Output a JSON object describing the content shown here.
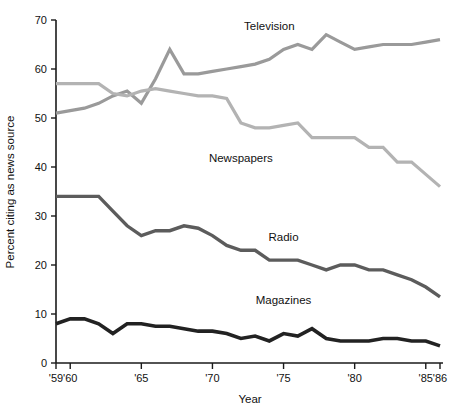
{
  "chart_data": {
    "type": "line",
    "title": "",
    "xlabel": "Year",
    "ylabel": "Percent citing as news source",
    "xlim": [
      1959,
      1986
    ],
    "ylim": [
      0,
      70
    ],
    "grid": false,
    "legend_position": "inline-labels",
    "x_tick_labels": [
      "'59",
      "'60",
      "'65",
      "'70",
      "'75",
      "'80",
      "'85",
      "'86"
    ],
    "x_tick_values": [
      1959,
      1960,
      1965,
      1970,
      1975,
      1980,
      1985,
      1986
    ],
    "y_tick_labels": [
      "0",
      "10",
      "20",
      "30",
      "40",
      "50",
      "60",
      "70"
    ],
    "y_tick_values": [
      0,
      10,
      20,
      30,
      40,
      50,
      60,
      70
    ],
    "x": [
      1959,
      1960,
      1961,
      1962,
      1963,
      1964,
      1965,
      1966,
      1967,
      1968,
      1969,
      1970,
      1971,
      1972,
      1973,
      1974,
      1975,
      1976,
      1977,
      1978,
      1979,
      1980,
      1981,
      1982,
      1983,
      1984,
      1985,
      1986
    ],
    "series": [
      {
        "name": "Television",
        "color": "#9a9a9a",
        "label_x": 1974,
        "label_y": 68,
        "values": [
          51,
          51.5,
          52,
          53,
          54.5,
          55.5,
          53,
          58,
          64,
          59,
          59,
          59.5,
          60,
          60.5,
          61,
          62,
          64,
          65,
          64,
          67,
          65.5,
          64,
          64.5,
          65,
          65,
          65,
          65.5,
          66
        ]
      },
      {
        "name": "Newspapers",
        "color": "#b3b3b3",
        "label_x": 1972,
        "label_y": 41,
        "values": [
          57,
          57,
          57,
          57,
          55,
          54.5,
          55.5,
          56,
          55.5,
          55,
          54.5,
          54.5,
          54,
          49,
          48,
          48,
          48.5,
          49,
          46,
          46,
          46,
          46,
          44,
          44,
          41,
          41,
          38.5,
          36
        ]
      },
      {
        "name": "Radio",
        "color": "#5c5c5c",
        "label_x": 1975,
        "label_y": 25,
        "values": [
          34,
          34,
          34,
          34,
          31,
          28,
          26,
          27,
          27,
          28,
          27.5,
          26,
          24,
          23,
          23,
          21,
          21,
          21,
          20,
          19,
          20,
          20,
          19,
          19,
          18,
          17,
          15.5,
          13.5
        ]
      },
      {
        "name": "Magazines",
        "color": "#222222",
        "label_x": 1975,
        "label_y": 12,
        "values": [
          8,
          9,
          9,
          8,
          6,
          8,
          8,
          7.5,
          7.5,
          7,
          6.5,
          6.5,
          6,
          5,
          5.5,
          4.5,
          6,
          5.5,
          7,
          5,
          4.5,
          4.5,
          4.5,
          5,
          5,
          4.5,
          4.5,
          3.5
        ]
      }
    ]
  }
}
